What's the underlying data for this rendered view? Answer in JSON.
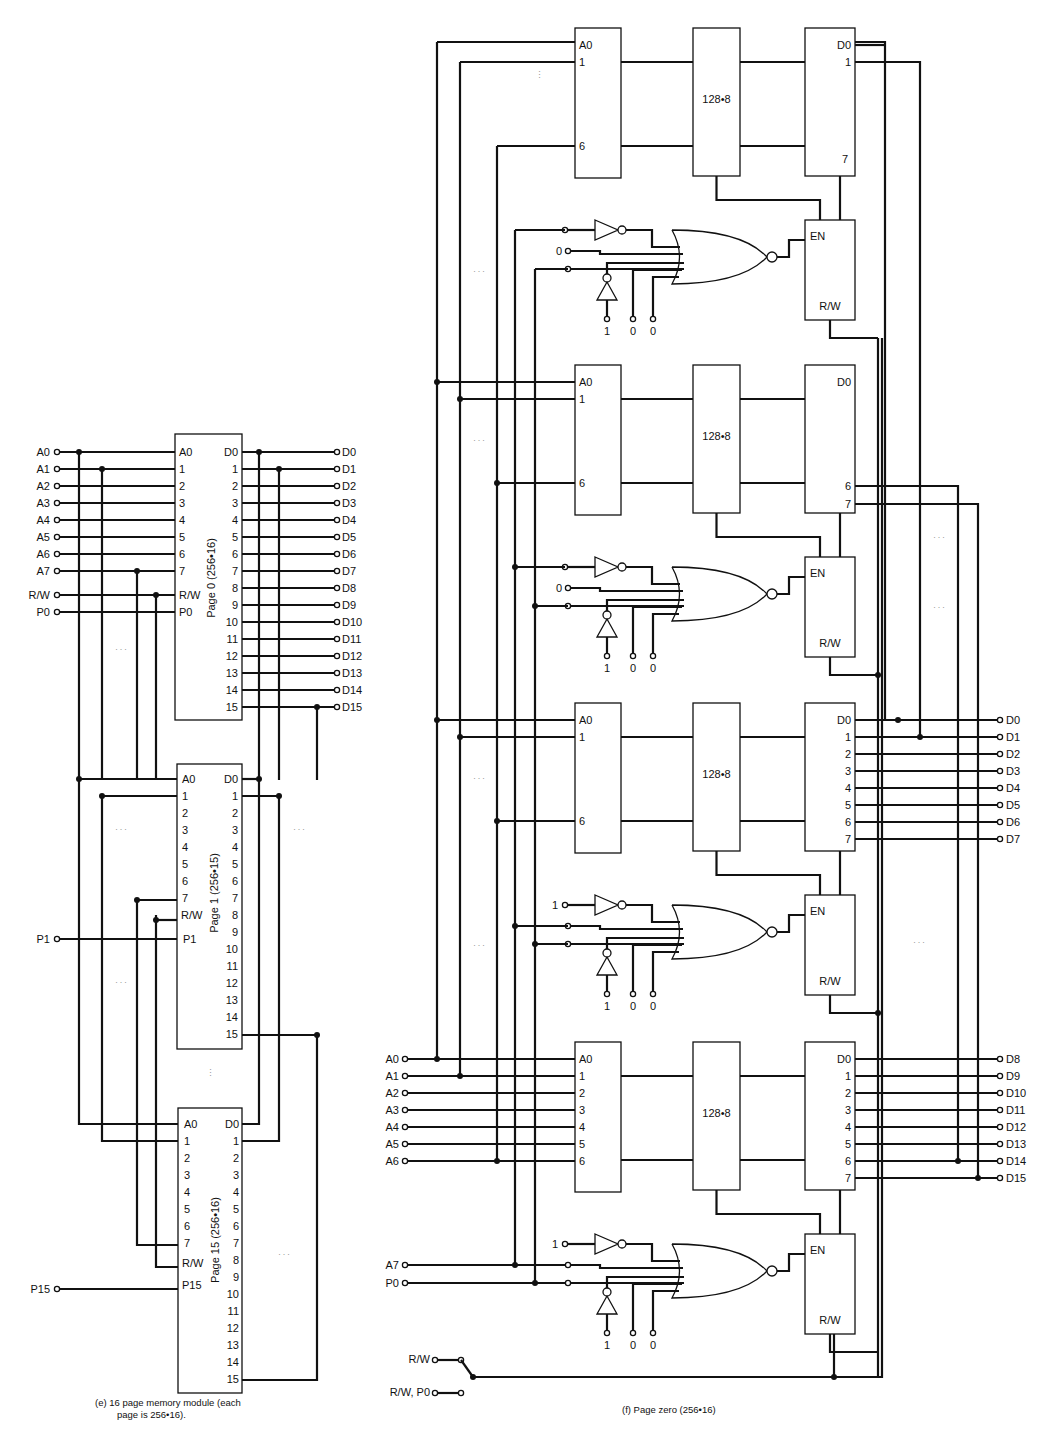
{
  "figure_e": {
    "caption_line1": "(e)  16 page memory module (each",
    "caption_line2": "page is 256•16).",
    "inputs": [
      "A0",
      "A1",
      "A2",
      "A3",
      "A4",
      "A5",
      "A6",
      "A7",
      "R/W",
      "P0"
    ],
    "outputs": [
      "D0",
      "D1",
      "D2",
      "D3",
      "D4",
      "D5",
      "D6",
      "D7",
      "D8",
      "D9",
      "D10",
      "D11",
      "D12",
      "D13",
      "D14",
      "D15"
    ],
    "pages": [
      {
        "title": "Page 0 (256•16)",
        "enable": "P0",
        "ext_input": "P0",
        "y": 448
      },
      {
        "title": "Page 1 (256•15)",
        "enable": "P1",
        "ext_input": "P1",
        "y": 779
      },
      {
        "title": "Page 15 (256•16)",
        "enable": "P15",
        "ext_input": "P15",
        "y": 1124
      }
    ],
    "left_pins": [
      "A0",
      "1",
      "2",
      "3",
      "4",
      "5",
      "6",
      "7",
      "R/W"
    ],
    "right_pins": [
      "D0",
      "1",
      "2",
      "3",
      "4",
      "5",
      "6",
      "7",
      "8",
      "9",
      "10",
      "11",
      "12",
      "13",
      "14",
      "15"
    ],
    "ellipsis": "...",
    "vertical_ellipsis": "⋮"
  },
  "figure_f": {
    "caption": "(f)  Page zero (256•16)",
    "chip_label": "128•8",
    "addr_pins_short": [
      "A0",
      "1",
      "6"
    ],
    "addr_pins_full": [
      "A0",
      "1",
      "2",
      "3",
      "4",
      "5",
      "6"
    ],
    "data_pins_top": [
      "D0",
      "1",
      "7"
    ],
    "data_pins_b2": [
      "D0",
      "6",
      "7"
    ],
    "data_pins_full": [
      "D0",
      "1",
      "2",
      "3",
      "4",
      "5",
      "6",
      "7"
    ],
    "en_label": "EN",
    "rw_label": "R/W",
    "gate_constants": [
      {
        "top": "",
        "mid": "0",
        "bottom": [
          "1",
          "0",
          "0"
        ]
      },
      {
        "top": "",
        "mid": "0",
        "bottom": [
          "1",
          "0",
          "0"
        ]
      },
      {
        "top": "1",
        "mid": "",
        "bottom": [
          "1",
          "0",
          "0"
        ]
      },
      {
        "top": "1",
        "mid": "",
        "bottom": [
          "1",
          "0",
          "0"
        ]
      }
    ],
    "inputs": [
      "A0",
      "A1",
      "A2",
      "A3",
      "A4",
      "A5",
      "A6"
    ],
    "control_inputs": [
      "A7",
      "P0"
    ],
    "outputs_low": [
      "D0",
      "D1",
      "D2",
      "D3",
      "D4",
      "D5",
      "D6",
      "D7"
    ],
    "outputs_high": [
      "D8",
      "D9",
      "D10",
      "D11",
      "D12",
      "D13",
      "D14",
      "D15"
    ],
    "switch_inputs": [
      "R/W",
      "R/W, P0"
    ]
  }
}
